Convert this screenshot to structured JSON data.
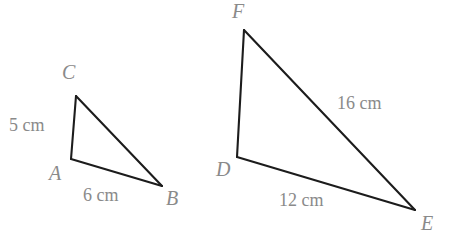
{
  "figure": {
    "background_color": "#ffffff",
    "stroke_color": "#1c1c1c",
    "label_color": "#8a8a8a",
    "width": 461,
    "height": 248
  },
  "triangles": [
    {
      "name": "triangle-abc",
      "vertices": [
        {
          "label": "C",
          "x": 76,
          "y": 96
        },
        {
          "label": "A",
          "x": 71,
          "y": 159
        },
        {
          "label": "B",
          "x": 162,
          "y": 186
        }
      ],
      "side_labels": [
        {
          "text": "5 cm",
          "between": "A-C"
        },
        {
          "text": "6 cm",
          "between": "A-B"
        }
      ]
    },
    {
      "name": "triangle-def",
      "vertices": [
        {
          "label": "F",
          "x": 244,
          "y": 30
        },
        {
          "label": "D",
          "x": 237,
          "y": 157
        },
        {
          "label": "E",
          "x": 415,
          "y": 210
        }
      ],
      "side_labels": [
        {
          "text": "16 cm",
          "between": "F-E"
        },
        {
          "text": "12 cm",
          "between": "D-E"
        }
      ]
    }
  ],
  "labels": {
    "vertex_c": "C",
    "vertex_a": "A",
    "vertex_b": "B",
    "vertex_f": "F",
    "vertex_d": "D",
    "vertex_e": "E",
    "side_ac": "5 cm",
    "side_ab": "6 cm",
    "side_fe": "16 cm",
    "side_de": "12 cm"
  }
}
